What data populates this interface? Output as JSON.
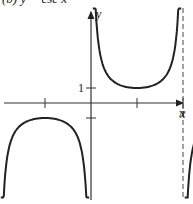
{
  "header_text": "(b) y = csc x",
  "chart_data": {
    "type": "line",
    "title": "y = csc x",
    "function": "csc",
    "xlabel": "x",
    "ylabel": "y",
    "xlim": [
      -4.71,
      4.71
    ],
    "ylim": [
      -6.5,
      6.5
    ],
    "x_ticks": [
      -4.712,
      -1.571,
      1.571,
      4.712
    ],
    "x_tick_labels": [
      {
        "value": 3.1416,
        "label": "π"
      }
    ],
    "y_ticks": [
      1,
      -1
    ],
    "y_tick_labels": [
      {
        "value": 1,
        "label": "1"
      }
    ],
    "asymptotes": [
      -3.1416,
      0,
      3.1416
    ],
    "series": [
      {
        "name": "branch-1",
        "domain": [
          -4.712,
          -3.2
        ]
      },
      {
        "name": "branch-2",
        "domain": [
          -3.08,
          -0.06
        ]
      },
      {
        "name": "branch-3",
        "domain": [
          0.06,
          3.08
        ]
      },
      {
        "name": "branch-4",
        "domain": [
          3.2,
          4.712
        ]
      }
    ],
    "grid": false
  }
}
